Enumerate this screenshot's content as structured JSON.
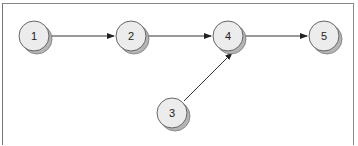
{
  "diagram": {
    "type": "directed-graph",
    "nodes": [
      {
        "id": "1",
        "label": "1",
        "cx": 34,
        "cy": 36
      },
      {
        "id": "2",
        "label": "2",
        "cx": 131,
        "cy": 36
      },
      {
        "id": "4",
        "label": "4",
        "cx": 228,
        "cy": 36
      },
      {
        "id": "5",
        "label": "5",
        "cx": 324,
        "cy": 36
      },
      {
        "id": "3",
        "label": "3",
        "cx": 172,
        "cy": 113
      }
    ],
    "edges": [
      {
        "from": "1",
        "to": "2"
      },
      {
        "from": "2",
        "to": "4"
      },
      {
        "from": "4",
        "to": "5"
      },
      {
        "from": "3",
        "to": "4"
      }
    ],
    "colors": {
      "node_fill": "#ececec",
      "node_stroke": "#666666",
      "shadow": "#b5b5b5",
      "edge": "#333333"
    }
  }
}
